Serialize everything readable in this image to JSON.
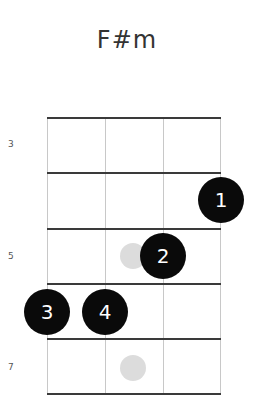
{
  "chord": {
    "name": "F#m"
  },
  "fret_labels": [
    "3",
    "5",
    "7"
  ],
  "fingers": [
    {
      "label": "1",
      "string": 3,
      "fret_row": 1
    },
    {
      "label": "2",
      "string": 2,
      "fret_row": 2
    },
    {
      "label": "3",
      "string": 0,
      "fret_row": 3
    },
    {
      "label": "4",
      "string": 1,
      "fret_row": 3
    }
  ],
  "ghost_markers": [
    {
      "fret_row": 2,
      "position": "between-string-1-2"
    },
    {
      "fret_row": 4,
      "position": "between-string-1-2"
    }
  ],
  "colors": {
    "finger_dot": "#0a0a0a",
    "ghost_dot": "#dcdcdc",
    "fret_line": "#3a3a3a",
    "string_line": "#c8c8c8"
  }
}
